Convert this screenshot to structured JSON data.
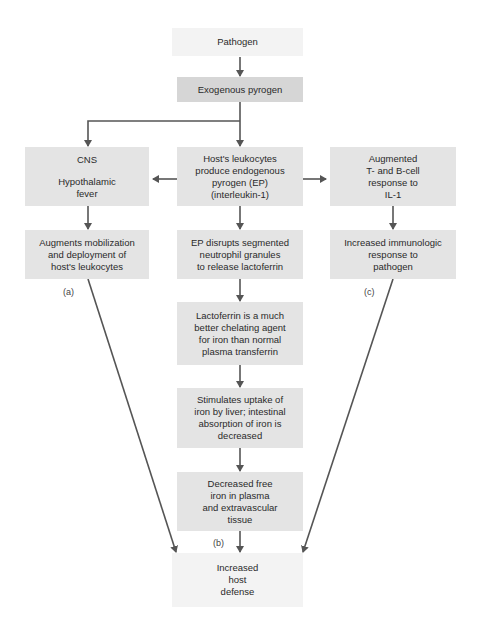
{
  "nodes": {
    "pathogen": "Pathogen",
    "exogenous_pyrogen": "Exogenous pyrogen",
    "cns": [
      "CNS",
      "",
      "Hypothalamic",
      "fever"
    ],
    "leukocytes_ep": [
      "Host's leukocytes",
      "produce endogenous",
      "pyrogen (EP)",
      "(interleukin-1)"
    ],
    "augmented_tb": [
      "Augmented",
      "T- and B-cell",
      "response to",
      "IL-1"
    ],
    "augments_mobilization": [
      "Augments mobilization",
      "and deployment of",
      "host's leukocytes"
    ],
    "ep_disrupts": [
      "EP disrupts segmented",
      "neutrophil granules",
      "to release lactoferrin"
    ],
    "increased_immunologic": [
      "Increased immunologic",
      "response to",
      "pathogen"
    ],
    "lactoferrin": [
      "Lactoferrin is a much",
      "better chelating agent",
      "for iron than normal",
      "plasma transferrin"
    ],
    "stimulates_uptake": [
      "Stimulates uptake of",
      "iron by liver; intestinal",
      "absorption of iron is",
      "decreased"
    ],
    "decreased_iron": [
      "Decreased free",
      "iron in plasma",
      "and extravascular",
      "tissue"
    ],
    "increased_defense": [
      "Increased",
      "host",
      "defense"
    ]
  },
  "labels": {
    "a": "(a)",
    "b": "(b)",
    "c": "(c)"
  },
  "colors": {
    "arrow": "#555555",
    "box_dark": "#d6d6d6",
    "box_mid": "#e4e4e4",
    "box_light": "#f3f3f3"
  }
}
